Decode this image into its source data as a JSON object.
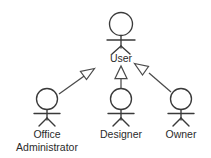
{
  "diagram": {
    "kind": "uml-actor-generalization-diagram",
    "background_color": "#ffffff",
    "stroke_color": "#3a3a3a",
    "text_color": "#2b2b2b",
    "parent_actor": {
      "id": "user",
      "label": "User",
      "label_lines": [
        "User"
      ],
      "cx": 121,
      "head_cy": 24,
      "head_r": 11.5,
      "label_y": 59
    },
    "child_actors": [
      {
        "id": "office-administrator",
        "label": "Office Administrator",
        "label_lines": [
          "Office",
          "Administrator"
        ],
        "cx": 47,
        "head_cy": 99,
        "head_r": 10.5,
        "label_y": 134
      },
      {
        "id": "designer",
        "label": "Designer",
        "label_lines": [
          "Designer"
        ],
        "cx": 121,
        "head_cy": 99,
        "head_r": 10.5,
        "label_y": 134
      },
      {
        "id": "owner",
        "label": "Owner",
        "label_lines": [
          "Owner"
        ],
        "cx": 181,
        "head_cy": 99,
        "head_r": 10.5,
        "label_y": 134
      }
    ],
    "relationships": [
      {
        "id": "rel-office-administrator-user",
        "type": "generalization",
        "from": "office-administrator",
        "to": "user",
        "arrowhead": "hollow-triangle",
        "direction": "up-right"
      },
      {
        "id": "rel-designer-user",
        "type": "generalization",
        "from": "designer",
        "to": "user",
        "arrowhead": "hollow-triangle",
        "direction": "up"
      },
      {
        "id": "rel-owner-user",
        "type": "generalization",
        "from": "owner",
        "to": "user",
        "arrowhead": "hollow-triangle",
        "direction": "up-left"
      }
    ]
  }
}
